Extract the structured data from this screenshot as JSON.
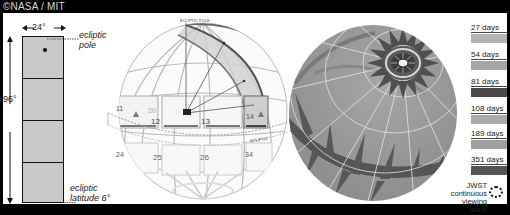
{
  "credit": "©NASA / MIT",
  "left_panel": {
    "width_label": "24°",
    "height_label": "96°",
    "pole_label_line1": "ecliptic",
    "pole_label_line2": "pole",
    "latitude_label_line1": "ecliptic",
    "latitude_label_line2": "latitude 6°",
    "strip_color": "#c8c8c8",
    "segments": 4
  },
  "middle_sphere": {
    "pole_label": "ECLIPTIC POLE",
    "ecliptic_label": "ECLIPTIC",
    "sector_numbers": [
      "11",
      "20",
      "12",
      "13",
      "14",
      "24",
      "25",
      "26",
      "34"
    ]
  },
  "legend": {
    "items": [
      {
        "label": "27 days",
        "color": "#b3b3b3"
      },
      {
        "label": "54 days",
        "color": "#a6a6a6"
      },
      {
        "label": "81 days",
        "color": "#4a4a4a"
      },
      {
        "label": "108 days",
        "color": "#aaaaaa"
      },
      {
        "label": "189 days",
        "color": "#a0a0a0"
      },
      {
        "label": "351 days",
        "color": "#555555"
      }
    ],
    "jwst_label_line1": "JWST",
    "jwst_label_line2": "continuous",
    "jwst_label_line3": "viewing zone"
  },
  "colors": {
    "background": "#000000",
    "panel": "#ffffff",
    "sphere_base": "#9a9a9a",
    "sphere_dark": "#545454",
    "grid": "#e6e6e6"
  }
}
